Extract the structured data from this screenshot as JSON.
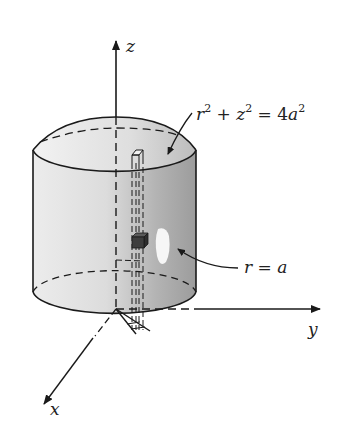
{
  "figure": {
    "axes": {
      "z_label": "z",
      "y_label": "y",
      "x_label": "x"
    },
    "annotations": {
      "sphere_equation": {
        "lhs_r": "r",
        "exp1": "2",
        "plus": " + ",
        "lhs_z": "z",
        "exp2": "2",
        "equals": " = 4",
        "rhs_a": "a",
        "exp3": "2"
      },
      "cylinder_equation": {
        "var": "r",
        "equals": " = ",
        "value": "a"
      }
    },
    "colors": {
      "stroke": "#1a1a1a",
      "cylinder_light": "#e6e6e6",
      "cylinder_dark": "#a8a8a8",
      "background": "#ffffff"
    }
  }
}
